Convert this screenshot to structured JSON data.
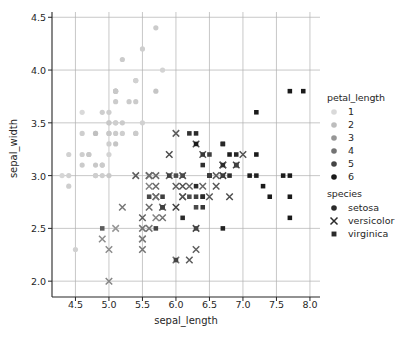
{
  "chart_data": {
    "type": "scatter",
    "title": "",
    "xlabel": "sepal_length",
    "ylabel": "sepal_width",
    "xlim": [
      4.15,
      8.15
    ],
    "ylim": [
      1.85,
      4.55
    ],
    "xticks": [
      4.5,
      5.0,
      5.5,
      6.0,
      6.5,
      7.0,
      7.5,
      8.0
    ],
    "xtick_labels": [
      "4.5",
      "5.0",
      "5.5",
      "6.0",
      "6.5",
      "7.0",
      "7.5",
      "8.0"
    ],
    "yticks": [
      2.0,
      2.5,
      3.0,
      3.5,
      4.0,
      4.5
    ],
    "ytick_labels": [
      "2.0",
      "2.5",
      "3.0",
      "3.5",
      "4.0",
      "4.5"
    ],
    "grid": true,
    "legend_position": "right",
    "hue_variable": "petal_length",
    "style_variable": "species",
    "hue_legend": {
      "title": "petal_length",
      "entries": [
        {
          "label": "1",
          "color": "#d9d9d9"
        },
        {
          "label": "2",
          "color": "#bdbdbd"
        },
        {
          "label": "3",
          "color": "#969696"
        },
        {
          "label": "4",
          "color": "#737373"
        },
        {
          "label": "5",
          "color": "#444444"
        },
        {
          "label": "6",
          "color": "#1a1a1a"
        }
      ]
    },
    "style_legend": {
      "title": "species",
      "entries": [
        {
          "label": "setosa",
          "marker": "circle"
        },
        {
          "label": "versicolor",
          "marker": "x"
        },
        {
          "label": "virginica",
          "marker": "square"
        }
      ]
    },
    "points": [
      {
        "x": 5.1,
        "y": 3.5,
        "petal_length": 1.4,
        "species": "setosa"
      },
      {
        "x": 4.9,
        "y": 3.0,
        "petal_length": 1.4,
        "species": "setosa"
      },
      {
        "x": 4.7,
        "y": 3.2,
        "petal_length": 1.3,
        "species": "setosa"
      },
      {
        "x": 4.6,
        "y": 3.1,
        "petal_length": 1.5,
        "species": "setosa"
      },
      {
        "x": 5.0,
        "y": 3.6,
        "petal_length": 1.4,
        "species": "setosa"
      },
      {
        "x": 5.4,
        "y": 3.9,
        "petal_length": 1.7,
        "species": "setosa"
      },
      {
        "x": 4.6,
        "y": 3.4,
        "petal_length": 1.4,
        "species": "setosa"
      },
      {
        "x": 5.0,
        "y": 3.4,
        "petal_length": 1.5,
        "species": "setosa"
      },
      {
        "x": 4.4,
        "y": 2.9,
        "petal_length": 1.4,
        "species": "setosa"
      },
      {
        "x": 4.9,
        "y": 3.1,
        "petal_length": 1.5,
        "species": "setosa"
      },
      {
        "x": 5.4,
        "y": 3.7,
        "petal_length": 1.5,
        "species": "setosa"
      },
      {
        "x": 4.8,
        "y": 3.4,
        "petal_length": 1.6,
        "species": "setosa"
      },
      {
        "x": 4.8,
        "y": 3.0,
        "petal_length": 1.4,
        "species": "setosa"
      },
      {
        "x": 4.3,
        "y": 3.0,
        "petal_length": 1.1,
        "species": "setosa"
      },
      {
        "x": 5.8,
        "y": 4.0,
        "petal_length": 1.2,
        "species": "setosa"
      },
      {
        "x": 5.7,
        "y": 4.4,
        "petal_length": 1.5,
        "species": "setosa"
      },
      {
        "x": 5.4,
        "y": 3.9,
        "petal_length": 1.3,
        "species": "setosa"
      },
      {
        "x": 5.1,
        "y": 3.5,
        "petal_length": 1.4,
        "species": "setosa"
      },
      {
        "x": 5.7,
        "y": 3.8,
        "petal_length": 1.7,
        "species": "setosa"
      },
      {
        "x": 5.1,
        "y": 3.8,
        "petal_length": 1.5,
        "species": "setosa"
      },
      {
        "x": 5.4,
        "y": 3.4,
        "petal_length": 1.7,
        "species": "setosa"
      },
      {
        "x": 5.1,
        "y": 3.7,
        "petal_length": 1.5,
        "species": "setosa"
      },
      {
        "x": 4.6,
        "y": 3.6,
        "petal_length": 1.0,
        "species": "setosa"
      },
      {
        "x": 5.1,
        "y": 3.3,
        "petal_length": 1.7,
        "species": "setosa"
      },
      {
        "x": 4.8,
        "y": 3.4,
        "petal_length": 1.9,
        "species": "setosa"
      },
      {
        "x": 5.0,
        "y": 3.0,
        "petal_length": 1.6,
        "species": "setosa"
      },
      {
        "x": 5.0,
        "y": 3.4,
        "petal_length": 1.6,
        "species": "setosa"
      },
      {
        "x": 5.2,
        "y": 3.5,
        "petal_length": 1.5,
        "species": "setosa"
      },
      {
        "x": 5.2,
        "y": 3.4,
        "petal_length": 1.4,
        "species": "setosa"
      },
      {
        "x": 4.7,
        "y": 3.2,
        "petal_length": 1.6,
        "species": "setosa"
      },
      {
        "x": 4.8,
        "y": 3.1,
        "petal_length": 1.6,
        "species": "setosa"
      },
      {
        "x": 5.4,
        "y": 3.4,
        "petal_length": 1.5,
        "species": "setosa"
      },
      {
        "x": 5.2,
        "y": 4.1,
        "petal_length": 1.5,
        "species": "setosa"
      },
      {
        "x": 5.5,
        "y": 4.2,
        "petal_length": 1.4,
        "species": "setosa"
      },
      {
        "x": 4.9,
        "y": 3.1,
        "petal_length": 1.5,
        "species": "setosa"
      },
      {
        "x": 5.0,
        "y": 3.2,
        "petal_length": 1.2,
        "species": "setosa"
      },
      {
        "x": 5.5,
        "y": 3.5,
        "petal_length": 1.3,
        "species": "setosa"
      },
      {
        "x": 4.9,
        "y": 3.6,
        "petal_length": 1.4,
        "species": "setosa"
      },
      {
        "x": 4.4,
        "y": 3.0,
        "petal_length": 1.3,
        "species": "setosa"
      },
      {
        "x": 5.1,
        "y": 3.4,
        "petal_length": 1.5,
        "species": "setosa"
      },
      {
        "x": 5.0,
        "y": 3.5,
        "petal_length": 1.3,
        "species": "setosa"
      },
      {
        "x": 4.5,
        "y": 2.3,
        "petal_length": 1.3,
        "species": "setosa"
      },
      {
        "x": 4.4,
        "y": 3.2,
        "petal_length": 1.3,
        "species": "setosa"
      },
      {
        "x": 5.0,
        "y": 3.5,
        "petal_length": 1.6,
        "species": "setosa"
      },
      {
        "x": 5.1,
        "y": 3.8,
        "petal_length": 1.9,
        "species": "setosa"
      },
      {
        "x": 4.8,
        "y": 3.0,
        "petal_length": 1.4,
        "species": "setosa"
      },
      {
        "x": 5.1,
        "y": 3.8,
        "petal_length": 1.6,
        "species": "setosa"
      },
      {
        "x": 4.6,
        "y": 3.2,
        "petal_length": 1.4,
        "species": "setosa"
      },
      {
        "x": 5.3,
        "y": 3.7,
        "petal_length": 1.5,
        "species": "setosa"
      },
      {
        "x": 5.0,
        "y": 3.3,
        "petal_length": 1.4,
        "species": "setosa"
      },
      {
        "x": 7.0,
        "y": 3.2,
        "petal_length": 4.7,
        "species": "versicolor"
      },
      {
        "x": 6.4,
        "y": 3.2,
        "petal_length": 4.5,
        "species": "versicolor"
      },
      {
        "x": 6.9,
        "y": 3.1,
        "petal_length": 4.9,
        "species": "versicolor"
      },
      {
        "x": 5.5,
        "y": 2.3,
        "petal_length": 4.0,
        "species": "versicolor"
      },
      {
        "x": 6.5,
        "y": 2.8,
        "petal_length": 4.6,
        "species": "versicolor"
      },
      {
        "x": 5.7,
        "y": 2.8,
        "petal_length": 4.5,
        "species": "versicolor"
      },
      {
        "x": 6.3,
        "y": 3.3,
        "petal_length": 4.7,
        "species": "versicolor"
      },
      {
        "x": 4.9,
        "y": 2.4,
        "petal_length": 3.3,
        "species": "versicolor"
      },
      {
        "x": 6.6,
        "y": 2.9,
        "petal_length": 4.6,
        "species": "versicolor"
      },
      {
        "x": 5.2,
        "y": 2.7,
        "petal_length": 3.9,
        "species": "versicolor"
      },
      {
        "x": 5.0,
        "y": 2.0,
        "petal_length": 3.5,
        "species": "versicolor"
      },
      {
        "x": 5.9,
        "y": 3.0,
        "petal_length": 4.2,
        "species": "versicolor"
      },
      {
        "x": 6.0,
        "y": 2.2,
        "petal_length": 4.0,
        "species": "versicolor"
      },
      {
        "x": 6.1,
        "y": 2.9,
        "petal_length": 4.7,
        "species": "versicolor"
      },
      {
        "x": 5.6,
        "y": 2.9,
        "petal_length": 3.6,
        "species": "versicolor"
      },
      {
        "x": 6.7,
        "y": 3.1,
        "petal_length": 4.4,
        "species": "versicolor"
      },
      {
        "x": 5.6,
        "y": 3.0,
        "petal_length": 4.5,
        "species": "versicolor"
      },
      {
        "x": 5.8,
        "y": 2.7,
        "petal_length": 4.1,
        "species": "versicolor"
      },
      {
        "x": 6.2,
        "y": 2.2,
        "petal_length": 4.5,
        "species": "versicolor"
      },
      {
        "x": 5.6,
        "y": 2.5,
        "petal_length": 3.9,
        "species": "versicolor"
      },
      {
        "x": 5.9,
        "y": 3.2,
        "petal_length": 4.8,
        "species": "versicolor"
      },
      {
        "x": 6.1,
        "y": 2.8,
        "petal_length": 4.0,
        "species": "versicolor"
      },
      {
        "x": 6.3,
        "y": 2.5,
        "petal_length": 4.9,
        "species": "versicolor"
      },
      {
        "x": 6.1,
        "y": 2.8,
        "petal_length": 4.7,
        "species": "versicolor"
      },
      {
        "x": 6.4,
        "y": 2.9,
        "petal_length": 4.3,
        "species": "versicolor"
      },
      {
        "x": 6.6,
        "y": 3.0,
        "petal_length": 4.4,
        "species": "versicolor"
      },
      {
        "x": 6.8,
        "y": 2.8,
        "petal_length": 4.8,
        "species": "versicolor"
      },
      {
        "x": 6.7,
        "y": 3.0,
        "petal_length": 5.0,
        "species": "versicolor"
      },
      {
        "x": 6.0,
        "y": 2.9,
        "petal_length": 4.5,
        "species": "versicolor"
      },
      {
        "x": 5.7,
        "y": 2.6,
        "petal_length": 3.5,
        "species": "versicolor"
      },
      {
        "x": 5.5,
        "y": 2.4,
        "petal_length": 3.8,
        "species": "versicolor"
      },
      {
        "x": 5.5,
        "y": 2.4,
        "petal_length": 3.7,
        "species": "versicolor"
      },
      {
        "x": 5.8,
        "y": 2.7,
        "petal_length": 3.9,
        "species": "versicolor"
      },
      {
        "x": 6.0,
        "y": 2.7,
        "petal_length": 5.1,
        "species": "versicolor"
      },
      {
        "x": 5.4,
        "y": 3.0,
        "petal_length": 4.5,
        "species": "versicolor"
      },
      {
        "x": 6.0,
        "y": 3.4,
        "petal_length": 4.5,
        "species": "versicolor"
      },
      {
        "x": 6.7,
        "y": 3.1,
        "petal_length": 4.7,
        "species": "versicolor"
      },
      {
        "x": 6.3,
        "y": 2.3,
        "petal_length": 4.4,
        "species": "versicolor"
      },
      {
        "x": 5.6,
        "y": 3.0,
        "petal_length": 4.1,
        "species": "versicolor"
      },
      {
        "x": 5.5,
        "y": 2.5,
        "petal_length": 4.0,
        "species": "versicolor"
      },
      {
        "x": 5.5,
        "y": 2.6,
        "petal_length": 4.4,
        "species": "versicolor"
      },
      {
        "x": 6.1,
        "y": 3.0,
        "petal_length": 4.6,
        "species": "versicolor"
      },
      {
        "x": 5.8,
        "y": 2.6,
        "petal_length": 4.0,
        "species": "versicolor"
      },
      {
        "x": 5.0,
        "y": 2.3,
        "petal_length": 3.3,
        "species": "versicolor"
      },
      {
        "x": 5.6,
        "y": 2.7,
        "petal_length": 4.2,
        "species": "versicolor"
      },
      {
        "x": 5.7,
        "y": 3.0,
        "petal_length": 4.2,
        "species": "versicolor"
      },
      {
        "x": 5.7,
        "y": 2.9,
        "petal_length": 4.2,
        "species": "versicolor"
      },
      {
        "x": 6.2,
        "y": 2.9,
        "petal_length": 4.3,
        "species": "versicolor"
      },
      {
        "x": 5.1,
        "y": 2.5,
        "petal_length": 3.0,
        "species": "versicolor"
      },
      {
        "x": 5.7,
        "y": 2.8,
        "petal_length": 4.1,
        "species": "versicolor"
      },
      {
        "x": 6.3,
        "y": 3.3,
        "petal_length": 6.0,
        "species": "virginica"
      },
      {
        "x": 5.8,
        "y": 2.7,
        "petal_length": 5.1,
        "species": "virginica"
      },
      {
        "x": 7.1,
        "y": 3.0,
        "petal_length": 5.9,
        "species": "virginica"
      },
      {
        "x": 6.3,
        "y": 2.9,
        "petal_length": 5.6,
        "species": "virginica"
      },
      {
        "x": 6.5,
        "y": 3.0,
        "petal_length": 5.8,
        "species": "virginica"
      },
      {
        "x": 7.6,
        "y": 3.0,
        "petal_length": 6.6,
        "species": "virginica"
      },
      {
        "x": 4.9,
        "y": 2.5,
        "petal_length": 4.5,
        "species": "virginica"
      },
      {
        "x": 7.3,
        "y": 2.9,
        "petal_length": 6.3,
        "species": "virginica"
      },
      {
        "x": 6.7,
        "y": 2.5,
        "petal_length": 5.8,
        "species": "virginica"
      },
      {
        "x": 7.2,
        "y": 3.6,
        "petal_length": 6.1,
        "species": "virginica"
      },
      {
        "x": 6.5,
        "y": 3.2,
        "petal_length": 5.1,
        "species": "virginica"
      },
      {
        "x": 6.4,
        "y": 2.7,
        "petal_length": 5.3,
        "species": "virginica"
      },
      {
        "x": 6.8,
        "y": 3.0,
        "petal_length": 5.5,
        "species": "virginica"
      },
      {
        "x": 5.7,
        "y": 2.5,
        "petal_length": 5.0,
        "species": "virginica"
      },
      {
        "x": 5.8,
        "y": 2.8,
        "petal_length": 5.1,
        "species": "virginica"
      },
      {
        "x": 6.4,
        "y": 3.2,
        "petal_length": 5.3,
        "species": "virginica"
      },
      {
        "x": 6.5,
        "y": 3.0,
        "petal_length": 5.5,
        "species": "virginica"
      },
      {
        "x": 7.7,
        "y": 3.8,
        "petal_length": 6.7,
        "species": "virginica"
      },
      {
        "x": 7.7,
        "y": 2.6,
        "petal_length": 6.9,
        "species": "virginica"
      },
      {
        "x": 6.0,
        "y": 2.2,
        "petal_length": 5.0,
        "species": "virginica"
      },
      {
        "x": 6.9,
        "y": 3.2,
        "petal_length": 5.7,
        "species": "virginica"
      },
      {
        "x": 5.6,
        "y": 2.8,
        "petal_length": 4.9,
        "species": "virginica"
      },
      {
        "x": 7.7,
        "y": 2.8,
        "petal_length": 6.7,
        "species": "virginica"
      },
      {
        "x": 6.3,
        "y": 2.7,
        "petal_length": 4.9,
        "species": "virginica"
      },
      {
        "x": 6.7,
        "y": 3.3,
        "petal_length": 5.7,
        "species": "virginica"
      },
      {
        "x": 7.2,
        "y": 3.2,
        "petal_length": 6.0,
        "species": "virginica"
      },
      {
        "x": 6.2,
        "y": 2.8,
        "petal_length": 4.8,
        "species": "virginica"
      },
      {
        "x": 6.1,
        "y": 3.0,
        "petal_length": 4.9,
        "species": "virginica"
      },
      {
        "x": 6.4,
        "y": 2.8,
        "petal_length": 5.6,
        "species": "virginica"
      },
      {
        "x": 7.2,
        "y": 3.0,
        "petal_length": 5.8,
        "species": "virginica"
      },
      {
        "x": 7.4,
        "y": 2.8,
        "petal_length": 6.1,
        "species": "virginica"
      },
      {
        "x": 7.9,
        "y": 3.8,
        "petal_length": 6.4,
        "species": "virginica"
      },
      {
        "x": 6.4,
        "y": 2.8,
        "petal_length": 5.6,
        "species": "virginica"
      },
      {
        "x": 6.3,
        "y": 2.8,
        "petal_length": 5.1,
        "species": "virginica"
      },
      {
        "x": 6.1,
        "y": 2.6,
        "petal_length": 5.6,
        "species": "virginica"
      },
      {
        "x": 7.7,
        "y": 3.0,
        "petal_length": 6.1,
        "species": "virginica"
      },
      {
        "x": 6.3,
        "y": 3.4,
        "petal_length": 5.6,
        "species": "virginica"
      },
      {
        "x": 6.4,
        "y": 3.1,
        "petal_length": 5.5,
        "species": "virginica"
      },
      {
        "x": 6.0,
        "y": 3.0,
        "petal_length": 4.8,
        "species": "virginica"
      },
      {
        "x": 6.9,
        "y": 3.1,
        "petal_length": 5.4,
        "species": "virginica"
      },
      {
        "x": 6.7,
        "y": 3.1,
        "petal_length": 5.6,
        "species": "virginica"
      },
      {
        "x": 6.9,
        "y": 3.1,
        "petal_length": 5.1,
        "species": "virginica"
      },
      {
        "x": 5.8,
        "y": 2.7,
        "petal_length": 5.1,
        "species": "virginica"
      },
      {
        "x": 6.8,
        "y": 3.2,
        "petal_length": 5.9,
        "species": "virginica"
      },
      {
        "x": 6.7,
        "y": 3.3,
        "petal_length": 5.7,
        "species": "virginica"
      },
      {
        "x": 6.7,
        "y": 3.0,
        "petal_length": 5.2,
        "species": "virginica"
      },
      {
        "x": 6.3,
        "y": 2.5,
        "petal_length": 5.0,
        "species": "virginica"
      },
      {
        "x": 6.5,
        "y": 3.0,
        "petal_length": 5.2,
        "species": "virginica"
      },
      {
        "x": 6.2,
        "y": 3.4,
        "petal_length": 5.4,
        "species": "virginica"
      },
      {
        "x": 5.9,
        "y": 3.0,
        "petal_length": 5.1,
        "species": "virginica"
      }
    ]
  }
}
